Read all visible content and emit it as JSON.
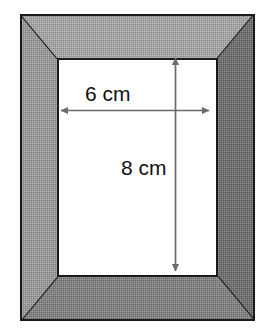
{
  "figure": {
    "background_color": "#ffffff"
  },
  "frame": {
    "name": "picture-frame",
    "border_color": "#1a1a1a",
    "bevels": [
      {
        "side": "top",
        "color": "#a6a6a6"
      },
      {
        "side": "left",
        "color": "#9a9a9a"
      },
      {
        "side": "right",
        "color": "#6f6f6f"
      },
      {
        "side": "bottom",
        "color": "#828282"
      }
    ],
    "texture": "dithered-checkerboard"
  },
  "picture_opening": {
    "name": "inner-white-rectangle",
    "fill_color": "#ffffff",
    "border_color": "#1a1a1a"
  },
  "dimensions": {
    "width": {
      "label": "6 cm",
      "value": 6,
      "unit": "cm",
      "orientation": "horizontal",
      "arrow_color": "#6b6b6b"
    },
    "height": {
      "label": "8 cm",
      "value": 8,
      "unit": "cm",
      "orientation": "vertical",
      "arrow_color": "#6b6b6b"
    }
  }
}
